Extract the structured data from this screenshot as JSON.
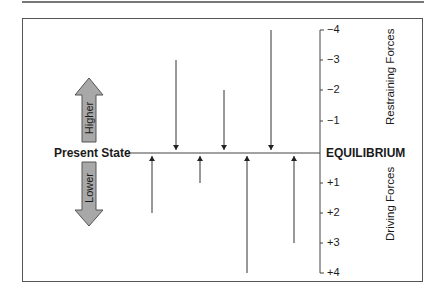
{
  "diagram": {
    "type": "force-field-analysis",
    "left_label": "Present State",
    "right_label": "EQUILIBRIUM",
    "direction_arrows": [
      {
        "label": "Higher",
        "direction": "up"
      },
      {
        "label": "Lower",
        "direction": "down"
      }
    ],
    "axis": {
      "upper_label": "Restraining Forces",
      "lower_label": "Driving Forces",
      "ticks_upper": [
        "−4",
        "−3",
        "−2",
        "−1"
      ],
      "ticks_lower": [
        "+1",
        "+2",
        "+3",
        "+4"
      ]
    },
    "restraining_forces": [
      3,
      2,
      4
    ],
    "driving_forces": [
      2,
      1,
      4,
      3
    ],
    "colors": {
      "arrow_fill": "#a8a8a8",
      "line": "#333333",
      "frame": "#555555"
    }
  }
}
